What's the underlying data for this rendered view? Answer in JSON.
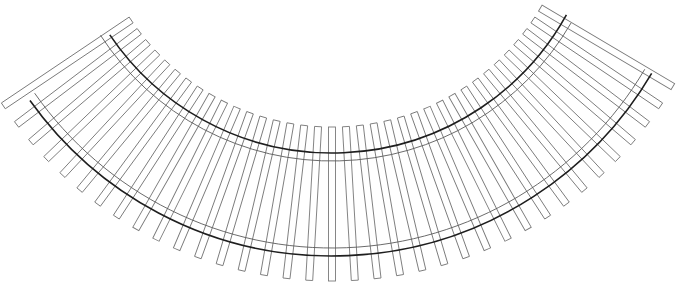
{
  "diagram": {
    "geometry": {
      "center": [
        332,
        -115
      ],
      "tie_inner_radius": 242,
      "tie_outer_radius": 396,
      "tie_width": 7,
      "tie_count": 36,
      "tie_angle_step_deg": 3.3,
      "tie_first_index": -17,
      "rails": [
        {
          "name": "inner-rail-running-edge",
          "radius": 268,
          "start_deg": -56,
          "end_deg": 61,
          "style": "thick"
        },
        {
          "name": "inner-rail-gauge-line",
          "radius": 276,
          "start_deg": -57,
          "end_deg": 60,
          "style": "thin"
        },
        {
          "name": "outer-rail-gauge-line",
          "radius": 363,
          "start_deg": -55,
          "end_deg": 59.5,
          "style": "thin"
        },
        {
          "name": "outer-rail-running-edge",
          "radius": 371,
          "start_deg": -54.5,
          "end_deg": 59.5,
          "style": "thick"
        }
      ]
    },
    "colors": {
      "background": "#ffffff",
      "tie_stroke": "#7a7a7a",
      "rail_thick": "#1e1e1e",
      "rail_thin": "#5a5a5a"
    }
  }
}
